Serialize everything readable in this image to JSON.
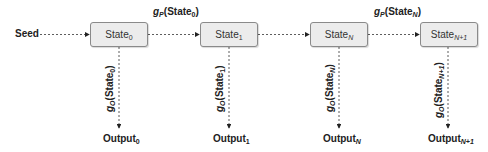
{
  "diagram": {
    "type": "state-transition-chain",
    "seed": {
      "label": "Seed"
    },
    "states": [
      {
        "base": "State",
        "sub": "0",
        "sub_italic": false
      },
      {
        "base": "State",
        "sub": "1",
        "sub_italic": false
      },
      {
        "base": "State",
        "sub": "N",
        "sub_italic": true
      },
      {
        "base": "State",
        "sub": "N+1",
        "sub_italic": true
      }
    ],
    "transition_labels": [
      {
        "func": "g",
        "func_sub": "P",
        "arg_base": "State",
        "arg_sub": "0",
        "between": [
          "State0",
          "State1"
        ]
      },
      {
        "func": "g",
        "func_sub": "P",
        "arg_base": "State",
        "arg_sub": "N",
        "between": [
          "StateN",
          "StateN+1"
        ]
      }
    ],
    "output_functions": [
      {
        "func": "g",
        "func_sub": "O",
        "arg_base": "State",
        "arg_sub": "0"
      },
      {
        "func": "g",
        "func_sub": "O",
        "arg_base": "State",
        "arg_sub": "1"
      },
      {
        "func": "g",
        "func_sub": "O",
        "arg_base": "State",
        "arg_sub": "N"
      },
      {
        "func": "g",
        "func_sub": "O",
        "arg_base": "State",
        "arg_sub": "N+1"
      }
    ],
    "outputs": [
      {
        "base": "Output",
        "sub": "0"
      },
      {
        "base": "Output",
        "sub": "1"
      },
      {
        "base": "Output",
        "sub": "N"
      },
      {
        "base": "Output",
        "sub": "N+1"
      }
    ],
    "colors": {
      "box_fill": "#ececec",
      "box_border": "#8a8a8a",
      "edge": "#333333",
      "text": "#222222"
    }
  }
}
